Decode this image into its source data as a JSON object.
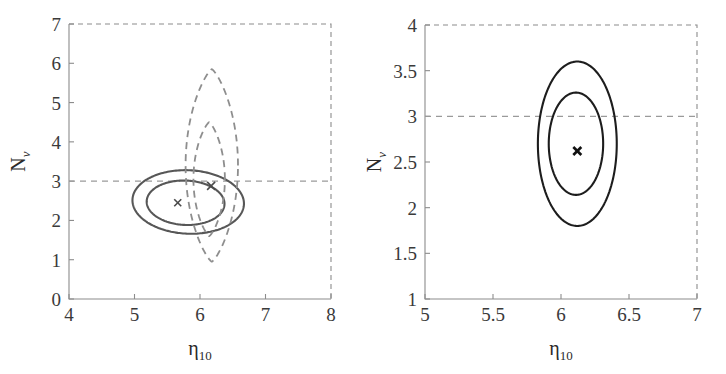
{
  "figure": {
    "width": 726,
    "height": 374,
    "background": "#ffffff",
    "panels": [
      "left",
      "right"
    ]
  },
  "chart_data": [
    {
      "id": "left",
      "type": "line",
      "subtype": "confidence-contour",
      "title": "",
      "xlabel": "η₁₀",
      "ylabel": "Nν",
      "xlabel_base": "η",
      "xlabel_sub": "10",
      "ylabel_base": "N",
      "ylabel_sub": "ν",
      "xlim": [
        4,
        8
      ],
      "ylim": [
        0,
        7
      ],
      "xticks": [
        4,
        5,
        6,
        7,
        8
      ],
      "xtick_labels": [
        "4",
        "5",
        "6",
        "7",
        "8"
      ],
      "yticks": [
        0,
        1,
        2,
        3,
        4,
        5,
        6,
        7
      ],
      "ytick_labels": [
        "0",
        "1",
        "2",
        "3",
        "4",
        "5",
        "6",
        "7"
      ],
      "grid": false,
      "legend": "none",
      "annotations": [
        {
          "name": "standard-model-line",
          "type": "hline",
          "y": 3,
          "style": "dashed",
          "color": "#9a9a9a"
        }
      ],
      "series": [
        {
          "name": "solid-outer-contour",
          "style": "solid",
          "color": "#575757",
          "shape": "tilted-ellipse",
          "center": [
            5.82,
            2.47
          ],
          "semi_x": 0.86,
          "semi_y": 0.8,
          "rotation_deg": -23,
          "description": "95% confidence region, BBN+CMB joint, tilted"
        },
        {
          "name": "solid-inner-contour",
          "style": "solid",
          "color": "#575757",
          "shape": "tilted-ellipse",
          "center": [
            5.78,
            2.45
          ],
          "semi_x": 0.6,
          "semi_y": 0.56,
          "rotation_deg": -23,
          "description": "68% confidence region, BBN+CMB joint, tilted"
        },
        {
          "name": "dashed-outer-contour",
          "style": "dashed",
          "color": "#8e8e8e",
          "shape": "vertical-lens",
          "center": [
            6.18,
            3.4
          ],
          "semi_x": 0.4,
          "semi_y": 2.45,
          "rotation_deg": 0,
          "description": "95% confidence region, CMB only, narrow vertical"
        },
        {
          "name": "dashed-inner-contour",
          "style": "dashed",
          "color": "#8e8e8e",
          "shape": "vertical-lens",
          "center": [
            6.14,
            3.05
          ],
          "semi_x": 0.24,
          "semi_y": 1.45,
          "rotation_deg": 0,
          "description": "68% confidence region, CMB only, narrow vertical"
        }
      ],
      "markers": [
        {
          "name": "best-fit-marker-a",
          "symbol": "x",
          "x": 5.66,
          "y": 2.45,
          "size": 7,
          "weight": "thin"
        },
        {
          "name": "best-fit-marker-b",
          "symbol": "x",
          "x": 6.17,
          "y": 2.88,
          "size": 8,
          "weight": "thin"
        }
      ]
    },
    {
      "id": "right",
      "type": "line",
      "subtype": "confidence-contour",
      "title": "",
      "xlabel": "η₁₀",
      "ylabel": "Nν",
      "xlabel_base": "η",
      "xlabel_sub": "10",
      "ylabel_base": "N",
      "ylabel_sub": "ν",
      "xlim": [
        5,
        7
      ],
      "ylim": [
        1,
        4
      ],
      "xticks": [
        5,
        5.5,
        6,
        6.5,
        7
      ],
      "xtick_labels": [
        "5",
        "5.5",
        "6",
        "6.5",
        "7"
      ],
      "yticks": [
        1,
        1.5,
        2,
        2.5,
        3,
        3.5,
        4
      ],
      "ytick_labels": [
        "1",
        "1.5",
        "2",
        "2.5",
        "3",
        "3.5",
        "4"
      ],
      "grid": false,
      "legend": "none",
      "annotations": [
        {
          "name": "standard-model-line",
          "type": "hline",
          "y": 3,
          "style": "dashed",
          "color": "#9a9a9a"
        }
      ],
      "series": [
        {
          "name": "solid-outer-contour",
          "style": "solid",
          "color": "#1d1d1d",
          "shape": "vertical-ellipse",
          "center": [
            6.12,
            2.7
          ],
          "semi_x": 0.29,
          "semi_y": 0.9,
          "rotation_deg": 0,
          "description": "95% confidence region, combined fit"
        },
        {
          "name": "solid-inner-contour",
          "style": "solid",
          "color": "#1d1d1d",
          "shape": "vertical-ellipse",
          "center": [
            6.11,
            2.7
          ],
          "semi_x": 0.2,
          "semi_y": 0.56,
          "rotation_deg": 0,
          "description": "68% confidence region, combined fit"
        }
      ],
      "markers": [
        {
          "name": "best-fit-marker",
          "symbol": "x",
          "x": 6.12,
          "y": 2.62,
          "size": 8,
          "weight": "bold"
        }
      ]
    }
  ]
}
